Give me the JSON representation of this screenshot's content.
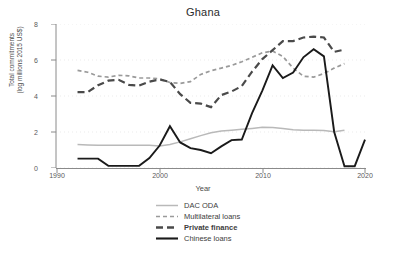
{
  "chart_data": {
    "type": "line",
    "title": "Ghana",
    "xlabel": "Year",
    "ylabel_line1": "Total commitments",
    "ylabel_line2": "(log millions 2015 US$)",
    "xlim": [
      1990,
      2020
    ],
    "ylim": [
      0,
      8
    ],
    "xticks": [
      1990,
      2000,
      2010,
      2020
    ],
    "yticks": [
      0,
      2,
      4,
      6,
      8
    ],
    "grid": true,
    "legend_position": "below",
    "x": [
      1992,
      1993,
      1994,
      1995,
      1996,
      1997,
      1998,
      1999,
      2000,
      2001,
      2002,
      2003,
      2004,
      2005,
      2006,
      2007,
      2008,
      2009,
      2010,
      2011,
      2012,
      2013,
      2014,
      2015,
      2016,
      2017,
      2018
    ],
    "series": [
      {
        "name": "DAC ODA",
        "color": "#b9b9b9",
        "style": "solid",
        "values": [
          1.3,
          1.28,
          1.26,
          1.26,
          1.27,
          1.27,
          1.27,
          1.26,
          1.22,
          1.3,
          1.45,
          1.62,
          1.8,
          1.96,
          2.05,
          2.1,
          2.15,
          2.2,
          2.26,
          2.25,
          2.2,
          2.12,
          2.1,
          2.1,
          2.08,
          2.02,
          2.1
        ]
      },
      {
        "name": "Multilateral loans",
        "color": "#9a9a9a",
        "style": "short-dash",
        "values": [
          5.42,
          5.32,
          5.1,
          5.05,
          5.15,
          5.12,
          5.0,
          5.0,
          4.95,
          4.75,
          4.7,
          4.8,
          5.2,
          5.4,
          5.55,
          5.7,
          5.9,
          6.15,
          6.4,
          6.5,
          6.2,
          5.55,
          5.1,
          5.05,
          5.25,
          5.55,
          5.8
        ]
      },
      {
        "name": "Private finance",
        "color": "#4a4a4a",
        "style": "long-dash",
        "values": [
          4.22,
          4.22,
          4.6,
          4.85,
          4.9,
          4.62,
          4.58,
          4.8,
          4.92,
          4.78,
          4.1,
          3.62,
          3.58,
          3.38,
          4.05,
          4.25,
          4.55,
          5.35,
          6.05,
          6.55,
          7.05,
          7.05,
          7.25,
          7.3,
          7.25,
          6.45,
          6.58
        ]
      },
      {
        "name": "Chinese loans",
        "color": "#1a1a1a",
        "style": "solid-bold",
        "values": [
          0.52,
          0.52,
          0.52,
          0.12,
          0.12,
          0.12,
          0.12,
          0.55,
          1.25,
          2.32,
          1.42,
          1.1,
          1.0,
          0.82,
          1.2,
          1.55,
          1.58,
          3.05,
          4.3,
          5.7,
          5.0,
          5.3,
          6.15,
          6.6,
          6.2,
          2.0,
          0.1
        ]
      }
    ],
    "chinese_loans_tail": {
      "x": [
        2018,
        2019,
        2020
      ],
      "values": [
        0.1,
        0.1,
        1.58
      ]
    }
  },
  "legend": {
    "entries": [
      {
        "label": "DAC ODA",
        "bold": false
      },
      {
        "label": "Multilateral loans",
        "bold": false
      },
      {
        "label": "Private finance",
        "bold": true
      },
      {
        "label": "Chinese loans",
        "bold": false
      }
    ]
  },
  "axis": {
    "ytick_labels": [
      "8",
      "6",
      "4",
      "2",
      "0"
    ],
    "xtick_labels": [
      "1990",
      "2000",
      "2010",
      "2020"
    ]
  }
}
